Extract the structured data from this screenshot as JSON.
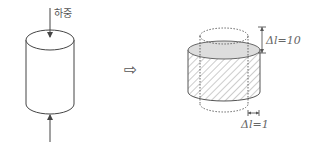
{
  "left_figure": {
    "load_label": "하중"
  },
  "transition_arrow": "⇨",
  "right_figure": {
    "vertical_change_label": "Δl=10",
    "horizontal_change_label": "Δl=1"
  },
  "colors": {
    "stroke": "#444444",
    "hatch": "#888888",
    "top_fill": "#dddddd",
    "dashed": "#555555"
  }
}
